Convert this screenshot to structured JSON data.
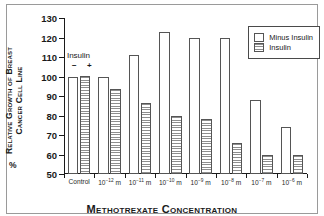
{
  "chart_data": {
    "type": "bar",
    "title": "",
    "xlabel": "Methotrexate Concentration",
    "ylabel": "% Relative Growth of Breast Cancer Cell Line",
    "ylabel_line1": "Relative Growth of Breast",
    "ylabel_line2": "Cancer Cell Line",
    "ylabel_prefix": "%",
    "ylim": [
      50,
      130
    ],
    "yticks": [
      50,
      60,
      70,
      80,
      90,
      100,
      110,
      120,
      130
    ],
    "ytick_labels": [
      "50",
      "60",
      "70",
      "80",
      "90",
      "100",
      "110",
      "120",
      "130"
    ],
    "grid": false,
    "legend_position": "top-right",
    "categories": [
      "Control",
      "10-12 m",
      "10-11 m",
      "10-10 m",
      "10-9 m",
      "10-8 m",
      "10-7 m",
      "10-6 m"
    ],
    "category_labels": [
      {
        "base": "Control",
        "exp": "",
        "unit": ""
      },
      {
        "base": "10",
        "exp": "-12",
        "unit": " m"
      },
      {
        "base": "10",
        "exp": "-11",
        "unit": " m"
      },
      {
        "base": "10",
        "exp": "-10",
        "unit": " m"
      },
      {
        "base": "10",
        "exp": "-9",
        "unit": " m"
      },
      {
        "base": "10",
        "exp": "-8",
        "unit": " m"
      },
      {
        "base": "10",
        "exp": "-7",
        "unit": " m"
      },
      {
        "base": "10",
        "exp": "-6",
        "unit": " m"
      }
    ],
    "series": [
      {
        "name": "Minus Insulin",
        "values": [
          100,
          100,
          111,
          123,
          120,
          120,
          88,
          74
        ]
      },
      {
        "name": "Insulin",
        "values": [
          100.5,
          93.5,
          86.5,
          80,
          78,
          66,
          59.5,
          59.5
        ]
      }
    ],
    "annotation": {
      "label": "Insulin",
      "minus_sign": "−",
      "plus_sign": "+"
    }
  },
  "legend": {
    "items": [
      {
        "label": "Minus Insulin",
        "swatch": "white-box"
      },
      {
        "label": "Insulin",
        "swatch": "striped-box"
      }
    ]
  },
  "colors": {
    "bar_minus_fill": "#ffffff",
    "bar_insulin_stripe": "#8e8e8e",
    "bar_outline": "#555555",
    "axis": "#1a1a1a",
    "frame": "#9a9a9a",
    "background": "#ffffff"
  }
}
